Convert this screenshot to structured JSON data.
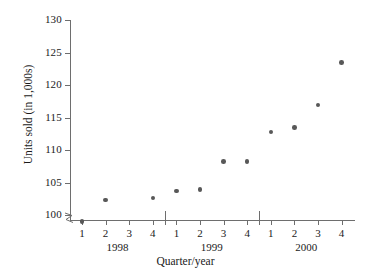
{
  "chart_data": {
    "type": "scatter",
    "title": "",
    "xlabel": "Quarter/year",
    "ylabel": "Units sold (in 1,000s)",
    "ylim": [
      100,
      130
    ],
    "y_ticks": [
      100,
      105,
      110,
      115,
      120,
      125,
      130
    ],
    "y_axis_break": true,
    "grid": false,
    "legend": false,
    "x_tick_labels": [
      "1",
      "2",
      "3",
      "4",
      "1",
      "2",
      "3",
      "4",
      "1",
      "2",
      "3",
      "4"
    ],
    "group_labels": [
      "1998",
      "1999",
      "2000"
    ],
    "categories": [
      "1 1998",
      "2 1998",
      "3 1998",
      "4 1998",
      "1 1999",
      "2 1999",
      "3 1999",
      "4 1999",
      "1 2000",
      "2 2000",
      "3 2000",
      "4 2000"
    ],
    "points": [
      {
        "label": "1 1998",
        "quarter": "1",
        "year": "1998",
        "x": 1,
        "y": 99.0
      },
      {
        "label": "2 1998",
        "quarter": "2",
        "year": "1998",
        "x": 2,
        "y": 102.3
      },
      {
        "label": "4 1998",
        "quarter": "4",
        "year": "1998",
        "x": 4,
        "y": 102.6
      },
      {
        "label": "1 1999",
        "quarter": "1",
        "year": "1999",
        "x": 5,
        "y": 103.7
      },
      {
        "label": "2 1999",
        "quarter": "2",
        "year": "1999",
        "x": 6,
        "y": 103.9
      },
      {
        "label": "3 1999",
        "quarter": "3",
        "year": "1999",
        "x": 7,
        "y": 108.2
      },
      {
        "label": "4 1999",
        "quarter": "4",
        "year": "1999",
        "x": 8,
        "y": 108.2
      },
      {
        "label": "1 2000",
        "quarter": "1",
        "year": "2000",
        "x": 9,
        "y": 112.8
      },
      {
        "label": "2 2000",
        "quarter": "2",
        "year": "2000",
        "x": 10,
        "y": 113.5
      },
      {
        "label": "3 2000",
        "quarter": "3",
        "year": "2000",
        "x": 11,
        "y": 116.9
      },
      {
        "label": "4 2000",
        "quarter": "4",
        "year": "2000",
        "x": 12,
        "y": 123.5
      }
    ],
    "marker_color": "#585858",
    "axis_color": "#6e6e6e",
    "text_color": "#1a1a1a"
  }
}
